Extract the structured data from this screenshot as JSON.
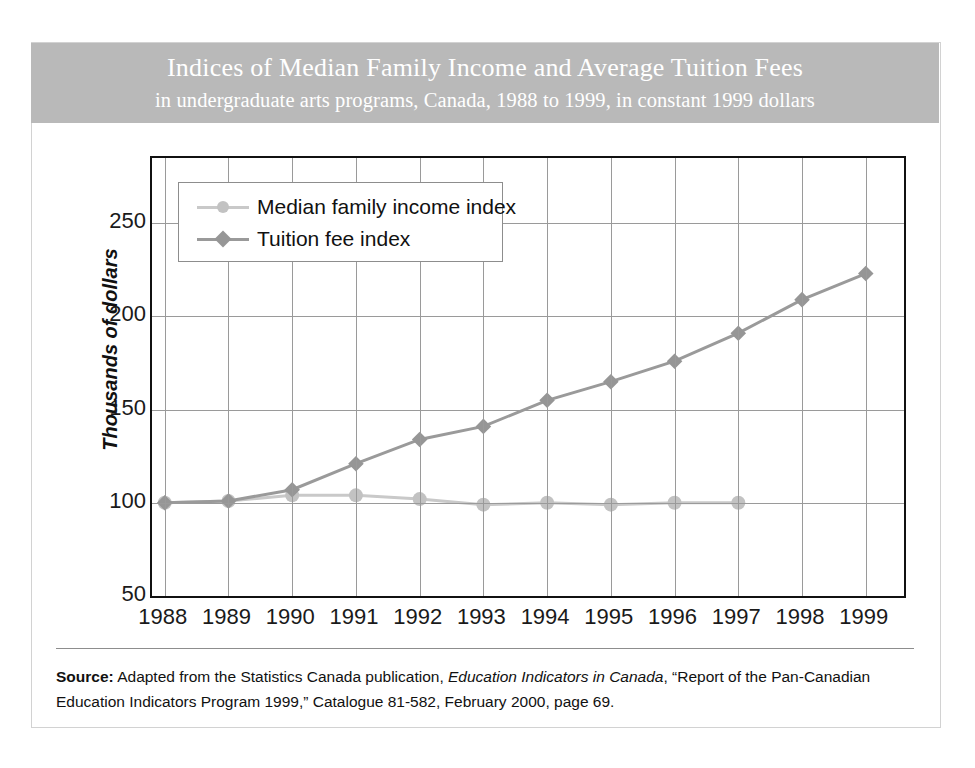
{
  "title": {
    "main": "Indices of Median Family Income and Average Tuition Fees",
    "sub": "in undergraduate arts programs, Canada, 1988 to 1999, in constant 1999 dollars"
  },
  "source": {
    "label": "Source:",
    "text_before_italic": " Adapted from the Statistics Canada publication, ",
    "italic": "Education Indicators in Canada",
    "text_after_italic": ", “Report of the Pan-Canadian Education Indicators Program 1999,” Catalogue 81-582, February 2000, page 69."
  },
  "colors": {
    "band": "#b9b9b9",
    "income_line": "#c9c9c9",
    "income_marker": "#c2c2c2",
    "tuition_line": "#9a9a9a",
    "tuition_marker": "#969696",
    "grid": "#9a9a9a",
    "frame": "#111111"
  },
  "chart_data": {
    "type": "line",
    "title": "Indices of Median Family Income and Average Tuition Fees",
    "subtitle": "in undergraduate arts programs, Canada, 1988 to 1999, in constant 1999 dollars",
    "xlabel": "",
    "ylabel": "Thousands of dollars",
    "x": [
      1988,
      1989,
      1990,
      1991,
      1992,
      1993,
      1994,
      1995,
      1996,
      1997,
      1998,
      1999
    ],
    "xtick_labels": [
      "1988",
      "1989",
      "1990",
      "1991",
      "1992",
      "1993",
      "1994",
      "1995",
      "1996",
      "1997",
      "1998",
      "1999"
    ],
    "ytick_labels": [
      "50",
      "100",
      "150",
      "200",
      "250"
    ],
    "yticks": [
      50,
      100,
      150,
      200,
      250
    ],
    "ylim": [
      50,
      285
    ],
    "xlim": [
      1987.8,
      1999.6
    ],
    "grid": true,
    "legend_position": "upper-left-inside",
    "series": [
      {
        "name": "Median family income index",
        "marker": "circle",
        "color": "#c9c9c9",
        "x": [
          1988,
          1989,
          1990,
          1991,
          1992,
          1993,
          1994,
          1995,
          1996,
          1997
        ],
        "values": [
          100,
          101,
          104,
          104,
          102,
          99,
          100,
          99,
          100,
          100
        ]
      },
      {
        "name": "Tuition fee index",
        "marker": "diamond",
        "color": "#9a9a9a",
        "x": [
          1988,
          1989,
          1990,
          1991,
          1992,
          1993,
          1994,
          1995,
          1996,
          1997,
          1998,
          1999
        ],
        "values": [
          100,
          101,
          107,
          121,
          134,
          141,
          155,
          165,
          176,
          191,
          209,
          223
        ]
      }
    ]
  }
}
